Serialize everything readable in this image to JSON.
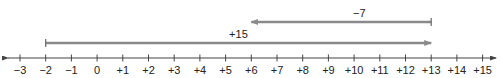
{
  "diagram": {
    "type": "number-line",
    "axis": {
      "min": -3,
      "max": 15,
      "step": 1,
      "tick_labels": [
        "−3",
        "−2",
        "−1",
        "0",
        "+1",
        "+2",
        "+3",
        "+4",
        "+5",
        "+6",
        "+7",
        "+8",
        "+9",
        "+10",
        "+11",
        "+12",
        "+13",
        "+14",
        "+15"
      ],
      "line_color": "#444444",
      "arrows": "both"
    },
    "arrows": [
      {
        "label": "+15",
        "from": -2,
        "to": 13,
        "direction": "right",
        "color": "#8a8a8a"
      },
      {
        "label": "−7",
        "from": 13,
        "to": 6,
        "direction": "left",
        "color": "#8a8a8a"
      }
    ]
  }
}
